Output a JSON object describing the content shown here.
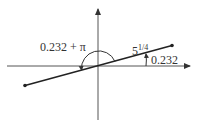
{
  "diagram": {
    "type": "polar-angle-diagram",
    "labels": {
      "big_angle": "0.232 + π",
      "magnitude_base": "5",
      "magnitude_exp": "1/4",
      "small_angle": "0.232"
    },
    "colors": {
      "line": "#222222",
      "axis": "#555555",
      "text": "#333333"
    }
  }
}
